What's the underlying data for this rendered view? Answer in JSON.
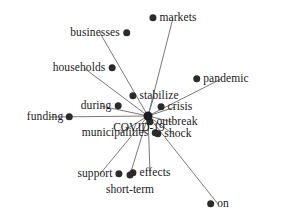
{
  "diagram": {
    "type": "radial-node-link-graph",
    "width": 281,
    "height": 220,
    "background_color": "#ffffff",
    "node_color": "#2b2b2b",
    "hub_color": "#1c1c1c",
    "edge_color": "#6b6b6b",
    "hub": {
      "label": "COVID-19",
      "x": 148,
      "y": 116,
      "label_x": 139,
      "label_y": 127,
      "radius": 4.5
    },
    "nodes": [
      {
        "label": "markets",
        "x": 173,
        "y": 18,
        "label_side": "right",
        "radius": 3.5
      },
      {
        "label": "businesses",
        "x": 100,
        "y": 33,
        "label_side": "left",
        "radius": 3.5
      },
      {
        "label": "households",
        "x": 84,
        "y": 68,
        "label_side": "left",
        "radius": 3.5
      },
      {
        "label": "pandemic",
        "x": 221,
        "y": 79,
        "label_side": "right",
        "radius": 3.5
      },
      {
        "label": "stabilize",
        "x": 154,
        "y": 96,
        "label_side": "right",
        "radius": 3.5
      },
      {
        "label": "during",
        "x": 101,
        "y": 106,
        "label_side": "left",
        "radius": 3.5
      },
      {
        "label": "crisis",
        "x": 175,
        "y": 107,
        "label_side": "right",
        "radius": 3.5
      },
      {
        "label": "funding",
        "x": 50,
        "y": 117,
        "label_side": "left",
        "radius": 3.5
      },
      {
        "label": "outbreak",
        "x": 172,
        "y": 122,
        "label_side": "right",
        "radius": 3.5
      },
      {
        "label": "shock",
        "x": 173,
        "y": 134,
        "label_side": "right",
        "radius": 3.5
      },
      {
        "label": "municipalities",
        "x": 120,
        "y": 133,
        "label_side": "left",
        "radius": 3.5
      },
      {
        "label": "effects",
        "x": 150,
        "y": 173,
        "label_side": "right",
        "radius": 3.5
      },
      {
        "label": "support",
        "x": 100,
        "y": 174,
        "label_side": "left",
        "radius": 3.5
      },
      {
        "label": "short-term",
        "x": 130,
        "y": 175,
        "label_side": "below",
        "radius": 3.5
      },
      {
        "label": "on",
        "x": 218,
        "y": 204,
        "label_side": "right",
        "radius": 3.5
      }
    ],
    "edges": [
      {
        "source": "COVID-19",
        "target": "markets"
      },
      {
        "source": "COVID-19",
        "target": "businesses"
      },
      {
        "source": "COVID-19",
        "target": "households"
      },
      {
        "source": "COVID-19",
        "target": "pandemic"
      },
      {
        "source": "COVID-19",
        "target": "stabilize"
      },
      {
        "source": "COVID-19",
        "target": "during"
      },
      {
        "source": "COVID-19",
        "target": "crisis"
      },
      {
        "source": "COVID-19",
        "target": "funding"
      },
      {
        "source": "COVID-19",
        "target": "outbreak"
      },
      {
        "source": "COVID-19",
        "target": "shock"
      },
      {
        "source": "COVID-19",
        "target": "municipalities"
      },
      {
        "source": "COVID-19",
        "target": "effects"
      },
      {
        "source": "COVID-19",
        "target": "support"
      },
      {
        "source": "COVID-19",
        "target": "short-term"
      },
      {
        "source": "COVID-19",
        "target": "on"
      }
    ]
  }
}
